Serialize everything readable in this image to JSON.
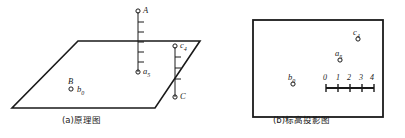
{
  "figure": {
    "panel_a": {
      "caption": "(a)原理图",
      "points": [
        {
          "id": "A",
          "label": "A",
          "sub": ""
        },
        {
          "id": "a5",
          "label": "a",
          "sub": "5"
        },
        {
          "id": "B",
          "label": "B",
          "sub": ""
        },
        {
          "id": "b0",
          "label": "b",
          "sub": "0"
        },
        {
          "id": "c4",
          "label": "c",
          "sub": "4"
        },
        {
          "id": "C",
          "label": "C",
          "sub": ""
        }
      ]
    },
    "panel_b": {
      "caption": "(b)标高投影图",
      "points": [
        {
          "id": "c4",
          "label": "c",
          "sub": "4"
        },
        {
          "id": "a5",
          "label": "a",
          "sub": "5"
        },
        {
          "id": "b0",
          "label": "b",
          "sub": "0"
        }
      ],
      "scale_bar": {
        "ticks": [
          "0",
          "1",
          "2",
          "3",
          "4"
        ]
      }
    }
  },
  "colors": {
    "ink": "#1a1a1a",
    "paper": "#ffffff"
  }
}
